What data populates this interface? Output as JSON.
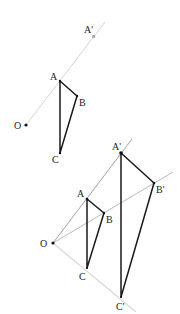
{
  "diagram": {
    "title": "",
    "colors": {
      "background": "#ffffff",
      "ray": "#d2d2d2",
      "ray_dark": "#8a8a8a",
      "edge": "#1a1a1a",
      "point": "#111111",
      "label": "#222222"
    },
    "figure_top": {
      "labels": {
        "A_prime": "A'",
        "A_prime_sub": "o",
        "A": "A",
        "B": "B",
        "C": "C",
        "O": "O"
      },
      "points": {
        "O": [
          26,
          125
        ],
        "A": [
          60,
          81
        ],
        "B": [
          77,
          96
        ],
        "C": [
          60,
          153
        ],
        "A_prime": [
          94,
          36
        ]
      }
    },
    "figure_bottom": {
      "labels": {
        "A_prime": "A'",
        "B_prime": "B'",
        "C_prime": "C'",
        "A": "A",
        "B": "B",
        "C": "C",
        "O": "O"
      },
      "points": {
        "O": [
          53,
          243
        ],
        "A": [
          87,
          199
        ],
        "B": [
          104,
          213
        ],
        "C": [
          87,
          268
        ],
        "A_prime": [
          121,
          153
        ],
        "B_prime": [
          154,
          183
        ],
        "C_prime": [
          121,
          297
        ]
      }
    }
  }
}
